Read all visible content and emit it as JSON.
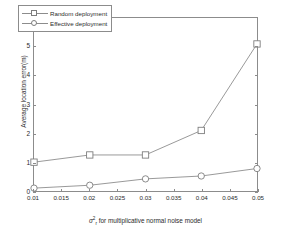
{
  "chart_data": {
    "type": "line",
    "title": "",
    "xlabel": "σ²ᵣ for multiplicative normal noise model",
    "xlabel_parts": {
      "symbol": "σ",
      "superscript": "2",
      "subscript": "r",
      "rest": " for multiplicative normal noise model"
    },
    "ylabel": "Average location error(m)",
    "x": [
      0.01,
      0.02,
      0.03,
      0.04,
      0.05
    ],
    "xlim": [
      0.01,
      0.05
    ],
    "ylim": [
      0,
      6
    ],
    "xticks": [
      "0.01",
      "0.015",
      "0.02",
      "0.025",
      "0.03",
      "0.035",
      "0.04",
      "0.045",
      "0.05"
    ],
    "xtick_values": [
      0.01,
      0.015,
      0.02,
      0.025,
      0.03,
      0.035,
      0.04,
      0.045,
      0.05
    ],
    "yticks": [
      "0",
      "1",
      "2",
      "3",
      "4",
      "5",
      "6"
    ],
    "ytick_values": [
      0,
      1,
      2,
      3,
      4,
      5,
      6
    ],
    "grid": false,
    "legend_position": "top-left",
    "series": [
      {
        "name": "Random deployment",
        "marker": "square",
        "values": [
          1.0,
          1.25,
          1.25,
          2.1,
          5.1
        ]
      },
      {
        "name": "Effective deployment",
        "marker": "circle",
        "values": [
          0.1,
          0.2,
          0.42,
          0.52,
          0.78
        ]
      }
    ],
    "colors": {
      "line": "#8c8c8c",
      "marker_edge": "#7d7d7d",
      "marker_face": "#ffffff",
      "axis": "#8c8c8c",
      "text": "#2b2b2b",
      "background": "#ffffff"
    }
  },
  "legend": {
    "items": [
      {
        "label": "Random deployment",
        "marker": "square"
      },
      {
        "label": "Effective deployment",
        "marker": "circle"
      }
    ]
  }
}
